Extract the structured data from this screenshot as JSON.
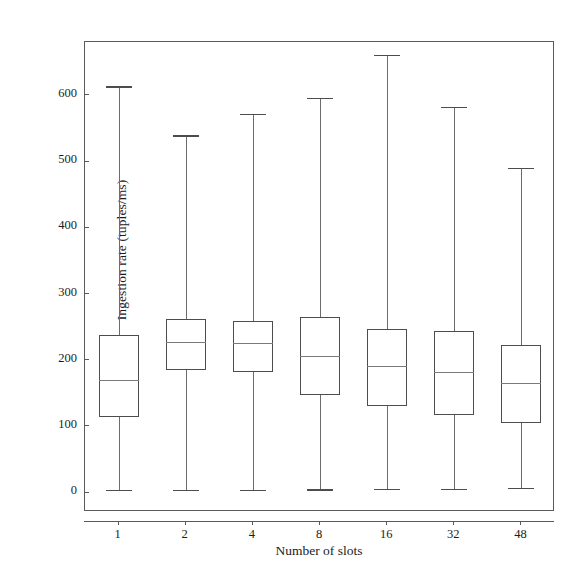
{
  "chart_data": {
    "type": "box",
    "title": "",
    "xlabel": "Number of slots",
    "ylabel": "Ingestion rate (tuples/ms)",
    "categories": [
      "1",
      "2",
      "4",
      "8",
      "16",
      "32",
      "48"
    ],
    "ylim": [
      -30,
      680
    ],
    "yticks": [
      0,
      100,
      200,
      300,
      400,
      500,
      600
    ],
    "ytick_labels": [
      "0",
      "100",
      "200",
      "300",
      "400",
      "500",
      "600"
    ],
    "grid": false,
    "legend": null,
    "boxes": [
      {
        "category": "1",
        "whisker_low": 3,
        "q1": 114,
        "median": 170,
        "q3": 238,
        "whisker_high": 613
      },
      {
        "category": "2",
        "whisker_low": 3,
        "q1": 185,
        "median": 227,
        "q3": 262,
        "whisker_high": 539
      },
      {
        "category": "4",
        "whisker_low": 3,
        "q1": 181,
        "median": 225,
        "q3": 258,
        "whisker_high": 571
      },
      {
        "category": "8",
        "whisker_low": 4,
        "q1": 147,
        "median": 206,
        "q3": 265,
        "whisker_high": 596
      },
      {
        "category": "16",
        "whisker_low": 5,
        "q1": 130,
        "median": 191,
        "q3": 247,
        "whisker_high": 660
      },
      {
        "category": "32",
        "whisker_low": 5,
        "q1": 117,
        "median": 181,
        "q3": 243,
        "whisker_high": 582
      },
      {
        "category": "48",
        "whisker_low": 6,
        "q1": 105,
        "median": 165,
        "q3": 222,
        "whisker_high": 490
      }
    ]
  },
  "style": {
    "box_edge_color": "#4d4d4d",
    "median_color": "#7a7a7a",
    "whisker_color": "#6b6b6b",
    "frame_color": "#5a5a5a",
    "background": "#ffffff",
    "text_color": "#1c1c1c"
  }
}
